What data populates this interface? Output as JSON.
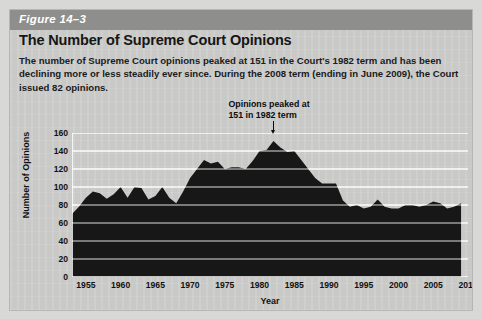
{
  "figure": {
    "label": "Figure 14–3",
    "title": "The Number of Supreme Court Opinions",
    "description": "The number of Supreme Court opinions peaked at 151 in the Court's 1982 term and has been declining more or less steadily ever since. During the 2008 term (ending in June 2009), the Court issued 82 opinions.",
    "band_color": "#8e8e8c",
    "card_color": "#c9c9c7",
    "series_color": "#171717"
  },
  "chart_data": {
    "type": "area",
    "title": "The Number of Supreme Court Opinions",
    "xlabel": "Year",
    "ylabel": "Number of Opinions",
    "xlim": [
      1953,
      2010
    ],
    "ylim": [
      0,
      160
    ],
    "grid": true,
    "legend": "none",
    "ytick_labels": [
      "160",
      "140",
      "120",
      "100",
      "80",
      "60",
      "40",
      "20",
      "0"
    ],
    "yticks": [
      160,
      140,
      120,
      100,
      80,
      60,
      40,
      20,
      0
    ],
    "xtick_labels": [
      "1955",
      "1960",
      "1965",
      "1970",
      "1975",
      "1980",
      "1985",
      "1990",
      "1995",
      "2000",
      "2005",
      "2010"
    ],
    "xticks": [
      1955,
      1960,
      1965,
      1970,
      1975,
      1980,
      1985,
      1990,
      1995,
      2000,
      2005,
      2010
    ],
    "annotations": [
      {
        "text_line1": "Opinions peaked at",
        "text_line2": "151 in 1982 term",
        "points_to_year": 1982,
        "points_to_value": 151
      }
    ],
    "x": [
      1953,
      1954,
      1955,
      1956,
      1957,
      1958,
      1959,
      1960,
      1961,
      1962,
      1963,
      1964,
      1965,
      1966,
      1967,
      1968,
      1969,
      1970,
      1971,
      1972,
      1973,
      1974,
      1975,
      1976,
      1977,
      1978,
      1979,
      1980,
      1981,
      1982,
      1983,
      1984,
      1985,
      1986,
      1987,
      1988,
      1989,
      1990,
      1991,
      1992,
      1993,
      1994,
      1995,
      1996,
      1997,
      1998,
      1999,
      2000,
      2001,
      2002,
      2003,
      2004,
      2005,
      2006,
      2007,
      2008,
      2009
    ],
    "values": [
      70,
      78,
      88,
      95,
      93,
      87,
      92,
      100,
      88,
      100,
      99,
      86,
      90,
      100,
      88,
      82,
      95,
      110,
      120,
      130,
      126,
      128,
      120,
      122,
      122,
      120,
      129,
      140,
      141,
      151,
      144,
      139,
      140,
      130,
      120,
      110,
      104,
      104,
      104,
      85,
      78,
      80,
      76,
      78,
      86,
      78,
      76,
      76,
      80,
      80,
      78,
      80,
      84,
      82,
      76,
      78,
      82
    ]
  },
  "axes": {
    "y_title": "Number of Opinions",
    "x_title": "Year"
  }
}
